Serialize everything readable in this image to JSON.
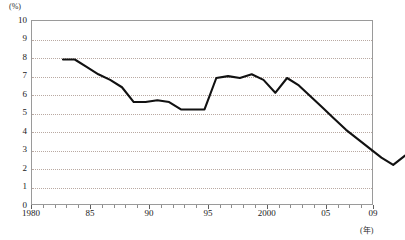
{
  "axes": {
    "y_unit_label": "(%)",
    "x_unit_label": "(年)",
    "y_ticks": [
      "10",
      "9",
      "8",
      "7",
      "6",
      "5",
      "4",
      "3",
      "2",
      "1",
      "0"
    ],
    "x_ticks": [
      "1980",
      "85",
      "90",
      "95",
      "2000",
      "05",
      "09"
    ]
  },
  "style": {
    "line_color": "#111111",
    "grid_color": "#b9a9a2",
    "frame_color": "#9a9a9a"
  },
  "chart_data": {
    "type": "line",
    "title": "",
    "subtitle": "",
    "xlabel": "(年)",
    "ylabel": "(%)",
    "xlim": [
      1980,
      2009
    ],
    "ylim": [
      0,
      10
    ],
    "grid": true,
    "legend": false,
    "x": [
      1980,
      1981,
      1982,
      1983,
      1984,
      1985,
      1986,
      1987,
      1988,
      1989,
      1990,
      1991,
      1992,
      1993,
      1994,
      1995,
      1996,
      1997,
      1998,
      1999,
      2000,
      2001,
      2002,
      2003,
      2004,
      2005,
      2006,
      2007,
      2008,
      2009
    ],
    "values": [
      9.0,
      9.0,
      8.6,
      8.2,
      7.9,
      7.5,
      6.7,
      6.7,
      6.8,
      6.7,
      6.3,
      6.3,
      6.3,
      8.0,
      8.1,
      8.0,
      8.2,
      7.9,
      7.2,
      8.0,
      7.6,
      7.0,
      6.4,
      5.8,
      5.2,
      4.7,
      4.2,
      3.7,
      3.3,
      3.8
    ],
    "x_tick_labels": [
      "1980",
      "85",
      "90",
      "95",
      "2000",
      "05",
      "09"
    ],
    "x_tick_values": [
      1980,
      1985,
      1990,
      1995,
      2000,
      2005,
      2009
    ],
    "y_tick_values": [
      0,
      1,
      2,
      3,
      4,
      5,
      6,
      7,
      8,
      9,
      10
    ]
  }
}
